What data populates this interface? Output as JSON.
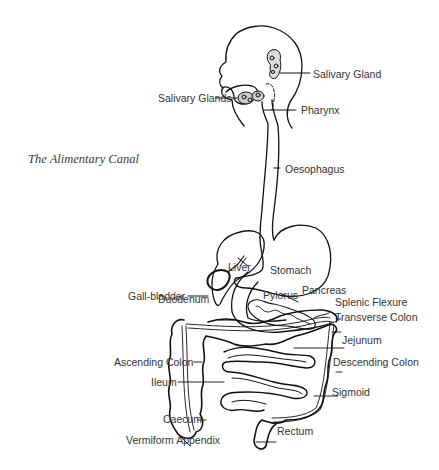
{
  "title": "The Alimentary Canal",
  "labels": {
    "salivary_gland": "Salivary Gland",
    "salivary_glands": "Salivary Glands",
    "pharynx": "Pharynx",
    "oesophagus": "Oesophagus",
    "liver": "Liver",
    "stomach": "Stomach",
    "gall_bladder": "Gall-bladder",
    "pylorus": "Pylorus",
    "pancreas": "Pancreas",
    "duodenum": "Duodenum",
    "splenic_flexure": "Splenic Flexure",
    "transverse_colon": "Transverse Colon",
    "jejunum": "Jejunum",
    "ascending_colon": "Ascending Colon",
    "descending_colon": "Descending Colon",
    "ileum": "Ileum",
    "sigmoid": "Sigmoid",
    "caecum": "Caecum",
    "vermiform_appendix": "Vermiform Appendix",
    "rectum": "Rectum"
  },
  "colors": {
    "line": "#111111",
    "label": "#333333",
    "background": "#ffffff"
  }
}
